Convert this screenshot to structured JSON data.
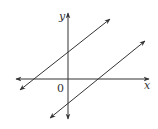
{
  "diagram": {
    "type": "coordinate-plane",
    "axes": {
      "x_label": "x",
      "y_label": "y",
      "origin_label": "0"
    },
    "lines": [
      {
        "name": "upper-line",
        "y_intercept": "positive",
        "slope": "positive"
      },
      {
        "name": "lower-line",
        "y_intercept": "negative",
        "slope": "positive"
      }
    ],
    "colors": {
      "stroke": "#333333",
      "background": "#ffffff"
    }
  }
}
